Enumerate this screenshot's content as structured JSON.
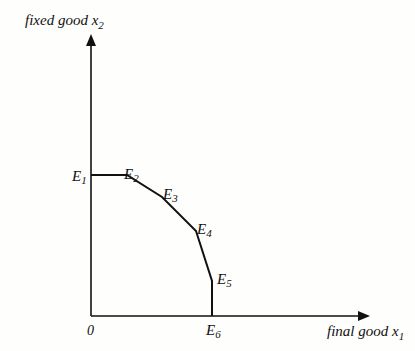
{
  "diagram": {
    "type": "production-possibility-frontier",
    "y_axis_label": {
      "text": "fixed good x",
      "subscript": "2"
    },
    "x_axis_label": {
      "text": "final good x",
      "subscript": "1"
    },
    "origin_label": "0",
    "points": [
      {
        "name": "E",
        "sub": "1",
        "x": 91,
        "y": 175
      },
      {
        "name": "E",
        "sub": "2",
        "x": 127,
        "y": 175
      },
      {
        "name": "E",
        "sub": "3",
        "x": 162,
        "y": 197
      },
      {
        "name": "E",
        "sub": "4",
        "x": 196,
        "y": 231
      },
      {
        "name": "E",
        "sub": "5",
        "x": 212,
        "y": 281
      },
      {
        "name": "E",
        "sub": "6",
        "x": 212,
        "y": 316
      }
    ],
    "colors": {
      "line": "#111111",
      "background": "#fefefc"
    }
  }
}
